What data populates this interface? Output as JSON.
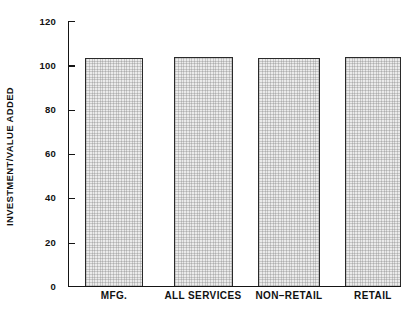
{
  "scan_header": {
    "left": "",
    "right": ""
  },
  "chart_data": {
    "type": "bar",
    "title": "",
    "subtitle": "",
    "xlabel": "",
    "ylabel": "INVESTMENT/VALUE ADDED",
    "categories": [
      "MFG.",
      "ALL SERVICES",
      "NON–RETAIL",
      "RETAIL"
    ],
    "values": [
      101,
      103.5,
      104,
      103.5
    ],
    "series": [
      {
        "name": "Investment/Value Added",
        "values": [
          101,
          103.5,
          104,
          103.5
        ]
      }
    ],
    "ylim": [
      0,
      120
    ],
    "ytick_values": [
      0,
      20,
      40,
      60,
      80,
      100,
      120
    ],
    "ytick_labels": [
      "0",
      "20",
      "40",
      "60",
      "80",
      "100",
      "120"
    ],
    "grid": false,
    "legend": null,
    "legend_position": "none",
    "bar_fill_color": "#ebebeb",
    "bar_edge_color": "#2a2a2a",
    "axis_color": "#151515",
    "background_color": "#ffffff",
    "tick_direction": "in",
    "annotations": []
  }
}
